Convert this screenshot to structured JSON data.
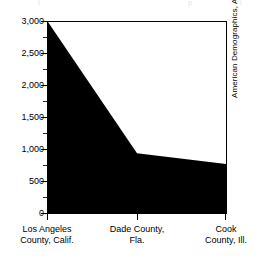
{
  "top_cut_text": {
    "segments": [
      "t",
      "p",
      "i"
    ],
    "note": "partially cropped text row at top edge of scan"
  },
  "source_credit": "American Demographics, April 1993.",
  "axis": {
    "y_tick_labels": [
      "3,000",
      "2,500",
      "2,000",
      "1,500",
      "1,000",
      "500",
      "0"
    ],
    "y_tick_values": [
      3000,
      2500,
      2000,
      1500,
      1000,
      500,
      0
    ],
    "y_minor_values": [
      2750,
      2250,
      1750,
      1250,
      750,
      250
    ],
    "y_min": 0,
    "y_max": 3000
  },
  "categories": [
    {
      "line1": "Los Angeles",
      "line2": "County, Calif."
    },
    {
      "line1": "Dade County,",
      "line2": "Fla."
    },
    {
      "line1": "Cook",
      "line2": "County, Ill."
    }
  ],
  "colors": {
    "area_fill": "#000000",
    "axis": "#000000",
    "background": "#ffffff",
    "text": "#000000"
  },
  "chart_data": {
    "type": "area",
    "title": "",
    "subtitle": "",
    "xlabel": "",
    "ylabel": "",
    "categories": [
      "Los Angeles County, Calif.",
      "Dade County, Fla.",
      "Cook County, Ill."
    ],
    "values": [
      3000,
      950,
      780
    ],
    "series": [
      {
        "name": "",
        "values": [
          3000,
          950,
          780
        ]
      }
    ],
    "ylim": [
      0,
      3000
    ],
    "ytick_values": [
      0,
      500,
      1000,
      1500,
      2000,
      2500,
      3000
    ],
    "ytick_labels": [
      "0",
      "500",
      "1,000",
      "1,500",
      "2,000",
      "2,500",
      "3,000"
    ],
    "yminor_tick_values": [
      250,
      750,
      1250,
      1750,
      2250,
      2750
    ],
    "grid": false,
    "legend": false,
    "legend_position": "none",
    "fill_color": "#000000",
    "annotations": [
      "American Demographics, April 1993."
    ]
  }
}
